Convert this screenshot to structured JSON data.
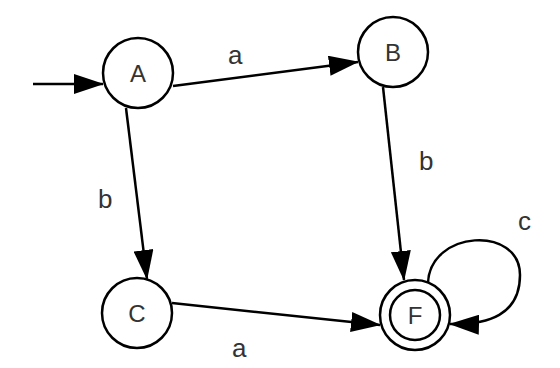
{
  "diagram": {
    "type": "finite-automaton",
    "start_state": "A",
    "accepting_states": [
      "F"
    ],
    "states": [
      {
        "id": "A",
        "label": "A",
        "cx": 138,
        "cy": 73,
        "accepting": false
      },
      {
        "id": "B",
        "label": "B",
        "cx": 393,
        "cy": 52,
        "accepting": false
      },
      {
        "id": "C",
        "label": "C",
        "cx": 137,
        "cy": 313,
        "accepting": false
      },
      {
        "id": "F",
        "label": "F",
        "cx": 415,
        "cy": 315,
        "accepting": true
      }
    ],
    "transitions": [
      {
        "from": "A",
        "to": "B",
        "symbol": "a"
      },
      {
        "from": "A",
        "to": "C",
        "symbol": "b"
      },
      {
        "from": "B",
        "to": "F",
        "symbol": "b"
      },
      {
        "from": "C",
        "to": "F",
        "symbol": "a"
      },
      {
        "from": "F",
        "to": "F",
        "symbol": "c"
      }
    ]
  }
}
